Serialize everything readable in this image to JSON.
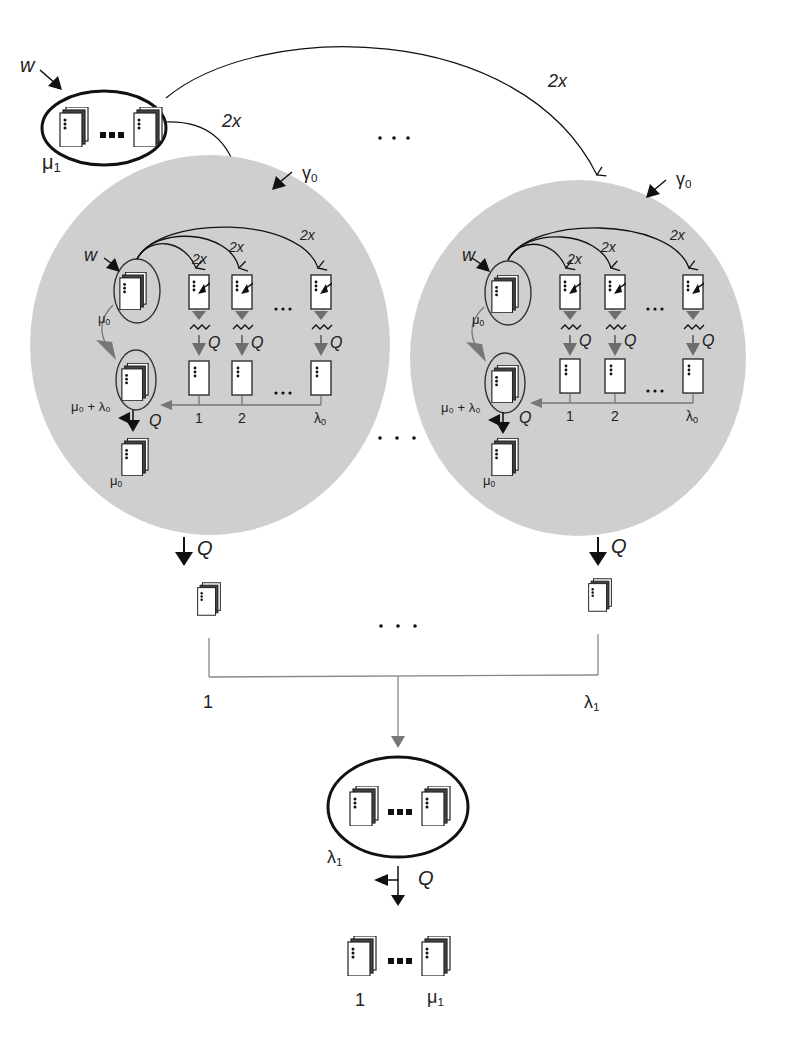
{
  "diagram": {
    "top_node": {
      "weight_label": "w",
      "size_label": "μ",
      "size_sub": "1",
      "ellipsis": "▪▪▪"
    },
    "top_edges": {
      "left_label": "2x",
      "right_label": "2x"
    },
    "between_clusters_top_ellipsis": ". . .",
    "clusters": [
      {
        "gamma_label": "γ",
        "gamma_sub": "0",
        "w_label": "w",
        "edge_labels": [
          "2x",
          "2x",
          "2x"
        ],
        "q_labels": [
          "Q",
          "Q",
          "Q"
        ],
        "mu0_label": "μ",
        "mu0_sub": "0",
        "mu_lambda_label": "μ₀ + λ₀",
        "out_q": "Q",
        "index_labels": [
          "1",
          "2"
        ],
        "last_index": "λ",
        "last_index_sub": "0",
        "row_ellipsis": "•••",
        "bottom_mu_label": "μ",
        "bottom_mu_sub": "0",
        "exit_q": "Q"
      },
      {
        "gamma_label": "γ",
        "gamma_sub": "0",
        "w_label": "w",
        "edge_labels": [
          "2x",
          "2x",
          "2x"
        ],
        "q_labels": [
          "Q",
          "Q",
          "Q"
        ],
        "mu0_label": "μ",
        "mu0_sub": "0",
        "mu_lambda_label": "μ₀ + λ₀",
        "out_q": "Q",
        "index_labels": [
          "1",
          "2"
        ],
        "last_index": "λ",
        "last_index_sub": "0",
        "row_ellipsis": "•••",
        "bottom_mu_label": "μ",
        "bottom_mu_sub": "0",
        "exit_q": "Q"
      }
    ],
    "between_clusters_mid_ellipsis": ". . .",
    "between_outputs_ellipsis": ". . .",
    "merge_labels": {
      "left": "1",
      "right": "λ",
      "right_sub": "1"
    },
    "collector_node": {
      "size_label": "λ",
      "size_sub": "1",
      "out_q": "Q"
    },
    "final_row": {
      "left_label": "1",
      "right_label": "μ",
      "right_sub": "1"
    }
  },
  "colors": {
    "cluster_fill": "#cfcfcf",
    "stroke": "#111111",
    "gray_arrow": "#6e6e6e",
    "connector": "#888888"
  }
}
